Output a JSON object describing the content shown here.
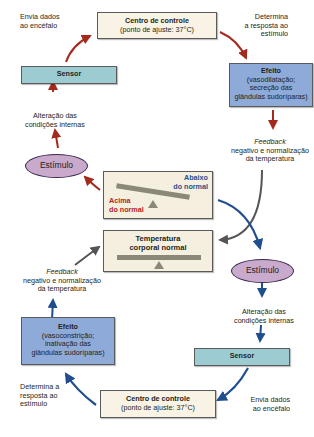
{
  "top_loop": {
    "control_center": {
      "title": "Centro de controle",
      "detail": "(ponto de ajuste: 37°C)"
    },
    "sends_data_label": [
      "Envia dados",
      "ao encéfalo"
    ],
    "determines_label": [
      "Determina",
      "a resposta ao",
      "estímulo"
    ],
    "sensor": "Sensor",
    "effector": {
      "title": "Efeito",
      "detail": [
        "(vasodilatação;",
        "secreção das",
        "glândulas sudoríparas)"
      ]
    },
    "change_label": [
      "Alteração das",
      "condições internas"
    ],
    "stimulus": "Estímulo",
    "feedback_label": {
      "italic": "Feedback",
      "rest": [
        "negativo e normalização",
        "da temperatura"
      ]
    }
  },
  "center": {
    "above_normal": [
      "Acima",
      "do normal"
    ],
    "below_normal": [
      "Abaixo",
      "do normal"
    ],
    "normal_temp": [
      "Temperatura",
      "corporal normal"
    ]
  },
  "bottom_loop": {
    "feedback_label": {
      "italic": "Feedback",
      "rest": [
        "negativo e normalização",
        "da temperatura"
      ]
    },
    "stimulus": "Estímulo",
    "change_label": [
      "Alteração das",
      "condições internas"
    ],
    "sensor": "Sensor",
    "effector": {
      "title": "Efeito",
      "detail": [
        "(vasoconstrição;",
        "inativação das",
        "glândulas sudoríparas)"
      ]
    },
    "determines_label": [
      "Determina a",
      "resposta ao",
      "estímulo"
    ],
    "control_center": {
      "title": "Centro de controle",
      "detail": "(ponto de ajuste: 37°C)"
    },
    "sends_data_label": [
      "Envia dados",
      "ao encéfalo"
    ]
  },
  "colors": {
    "hot_arrow": "#a52a1e",
    "cold_arrow": "#1f4e8f",
    "feedback_arrow": "#555555",
    "control_center_fill": "#f8f3e4",
    "sensor_fill": "#9ccbd1",
    "effector_fill": "#8eaad8",
    "stimulus_fill": "#c9a9cc"
  }
}
